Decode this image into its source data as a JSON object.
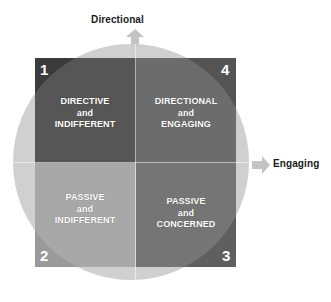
{
  "diagram": {
    "axes": {
      "vertical": {
        "label": "Directional",
        "arrow_icon": "arrow-up-icon",
        "direction": "up"
      },
      "horizontal": {
        "label": "Engaging",
        "arrow_icon": "arrow-right-icon",
        "direction": "right"
      }
    },
    "quadrants": [
      {
        "number": "1",
        "position": "top-left",
        "line1": "DIRECTIVE",
        "line2": "and",
        "line3": "INDIFFERENT",
        "fill": "#3b3b3b"
      },
      {
        "number": "4",
        "position": "top-right",
        "line1": "DIRECTIONAL",
        "line2": "and",
        "line3": "ENGAGING",
        "fill": "#545454"
      },
      {
        "number": "2",
        "position": "bottom-left",
        "line1": "PASSIVE",
        "line2": "and",
        "line3": "INDIFFERENT",
        "fill": "#9a9a9a"
      },
      {
        "number": "3",
        "position": "bottom-right",
        "line1": "PASSIVE",
        "line2": "and",
        "line3": "CONCERNED",
        "fill": "#5f5f5f"
      }
    ],
    "colors": {
      "arrow": "#c3c3c3",
      "circle_overlay": "#c9c9c9",
      "label_text": "#1a1a1a",
      "quadrant_text": "#ffffff",
      "background": "#ffffff"
    }
  }
}
